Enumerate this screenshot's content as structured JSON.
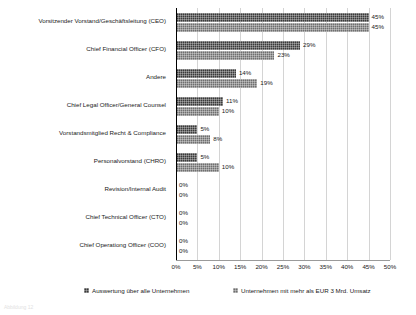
{
  "chart_data": {
    "type": "bar",
    "orientation": "horizontal",
    "title": "",
    "xlabel": "",
    "ylabel": "",
    "xlim": [
      0,
      50
    ],
    "grid": true,
    "legend_position": "bottom",
    "xticks": [
      "0%",
      "5%",
      "10%",
      "15%",
      "20%",
      "25%",
      "30%",
      "35%",
      "40%",
      "45%",
      "50%"
    ],
    "xtick_values": [
      0,
      5,
      10,
      15,
      20,
      25,
      30,
      35,
      40,
      45,
      50
    ],
    "categories": [
      "Vorsitzender Vorstand/Geschäftsleitung (CEO)",
      "Chief Financial Officer (CFO)",
      "Andere",
      "Chief Legal Officer/General Counsel",
      "Vorstandsmitglied Recht & Compliance",
      "Personalvorstand (CHRO)",
      "Revision/Internal Audit",
      "Chief Technical Officer (CTO)",
      "Chief Operationg Officer (COO)"
    ],
    "series": [
      {
        "name": "Auswertung über alle Unternehmen",
        "values": [
          45,
          29,
          14,
          11,
          5,
          5,
          0,
          0,
          0
        ],
        "labels": [
          "45%",
          "29%",
          "14%",
          "11%",
          "5%",
          "5%",
          "0%",
          "0%",
          "0%"
        ],
        "color": "#3a3a3a"
      },
      {
        "name": "Unternehmen mit mehr als EUR 3 Mrd. Umsatz",
        "values": [
          45,
          23,
          19,
          10,
          8,
          10,
          0,
          0,
          0
        ],
        "labels": [
          "45%",
          "23%",
          "19%",
          "10%",
          "8%",
          "10%",
          "0%",
          "0%",
          "0%"
        ],
        "color": "#6f6f6f"
      }
    ]
  },
  "legend": {
    "items": [
      "Auswertung über alle Unternehmen",
      "Unternehmen mit mehr als EUR 3 Mrd. Umsatz"
    ]
  },
  "footnote": {
    "text": "Abbildung 12"
  }
}
